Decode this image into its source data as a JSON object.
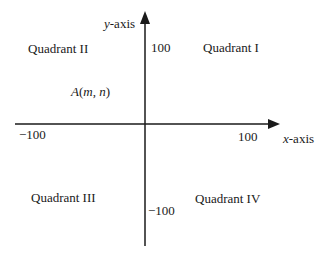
{
  "axes": {
    "x_label_var": "x",
    "x_label_suffix": "-axis",
    "y_label_var": "y",
    "y_label_suffix": "-axis",
    "x_neg_tick": "−100",
    "x_pos_tick": "100",
    "y_pos_tick": "100",
    "y_neg_tick": "−100",
    "color": "#1a1a1a"
  },
  "quadrants": {
    "q1": "Quadrant I",
    "q2": "Quadrant II",
    "q3": "Quadrant III",
    "q4": "Quadrant IV"
  },
  "point": {
    "name": "A",
    "open": "(",
    "m": "m",
    "sep": ", ",
    "n": "n",
    "close": ")"
  }
}
